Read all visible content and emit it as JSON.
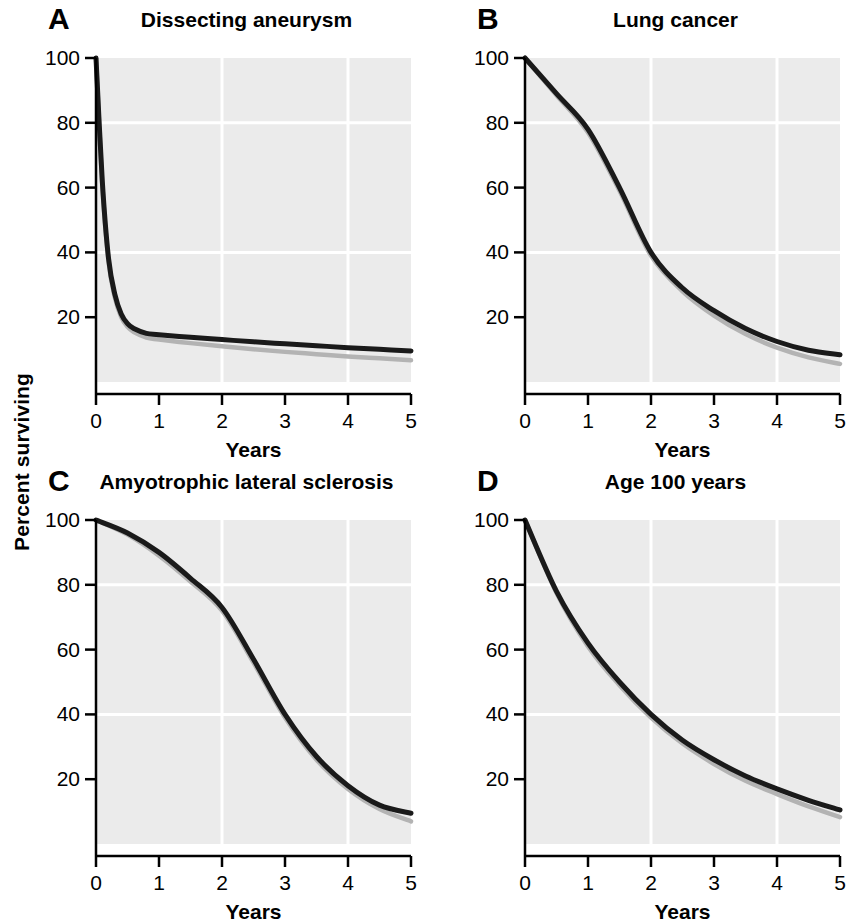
{
  "figure": {
    "shared_ylabel": "Percent surviving",
    "background_color": "#ffffff",
    "plot_area_color": "#ebebeb",
    "gridline_color": "#ffffff",
    "primary_curve_color": "#1a1a1a",
    "secondary_curve_color": "#b3b3b3",
    "axis_color": "#000000"
  },
  "axes_common": {
    "xlabel": "Years",
    "xticks": [
      "0",
      "1",
      "2",
      "3",
      "4",
      "5"
    ],
    "yticks": [
      "20",
      "40",
      "60",
      "80",
      "100"
    ],
    "xlim": [
      0,
      5
    ],
    "ylim": [
      0,
      100
    ],
    "x_gridlines": [
      2,
      4
    ],
    "y_gridlines": [
      40,
      80
    ]
  },
  "panels": [
    {
      "letter": "A",
      "title": "Dissecting aneurysm"
    },
    {
      "letter": "B",
      "title": "Lung cancer"
    },
    {
      "letter": "C",
      "title": "Amyotrophic lateral sclerosis"
    },
    {
      "letter": "D",
      "title": "Age 100 years"
    }
  ],
  "chart_data": [
    {
      "type": "line",
      "panel": "A",
      "title": "Dissecting aneurysm",
      "xlabel": "Years",
      "ylabel": "Percent surviving",
      "xlim": [
        0,
        5
      ],
      "ylim": [
        0,
        100
      ],
      "xticks": [
        0,
        1,
        2,
        3,
        4,
        5
      ],
      "yticks": [
        20,
        40,
        60,
        80,
        100
      ],
      "grid": true,
      "legend": "none",
      "x": [
        0,
        0.1,
        0.2,
        0.3,
        0.4,
        0.5,
        0.6,
        0.8,
        1,
        1.5,
        2,
        2.5,
        3,
        3.5,
        4,
        4.5,
        5
      ],
      "series": [
        {
          "name": "Observed survival",
          "color": "#1a1a1a",
          "values": [
            100,
            62,
            38,
            27,
            21,
            18,
            16.5,
            15,
            14.6,
            13.8,
            13.1,
            12.4,
            11.8,
            11.2,
            10.6,
            10.1,
            9.6
          ]
        },
        {
          "name": "Expected survival",
          "color": "#b3b3b3",
          "values": [
            100,
            61,
            37,
            26,
            20,
            17,
            15.4,
            13.7,
            13.1,
            12.0,
            11.0,
            10.1,
            9.3,
            8.6,
            7.9,
            7.3,
            6.7
          ]
        }
      ]
    },
    {
      "type": "line",
      "panel": "B",
      "title": "Lung cancer",
      "xlabel": "Years",
      "ylabel": "Percent surviving",
      "xlim": [
        0,
        5
      ],
      "ylim": [
        0,
        100
      ],
      "xticks": [
        0,
        1,
        2,
        3,
        4,
        5
      ],
      "yticks": [
        20,
        40,
        60,
        80,
        100
      ],
      "grid": true,
      "legend": "none",
      "x": [
        0,
        0.5,
        1,
        1.5,
        2,
        2.5,
        3,
        3.5,
        4,
        4.5,
        5
      ],
      "series": [
        {
          "name": "Observed survival",
          "color": "#1a1a1a",
          "values": [
            100,
            89,
            78,
            60,
            40,
            29,
            22,
            16.5,
            12.5,
            9.8,
            8.4
          ]
        },
        {
          "name": "Expected survival",
          "color": "#b3b3b3",
          "values": [
            100,
            88.5,
            77,
            59,
            39,
            28,
            20.5,
            14.8,
            10.6,
            7.6,
            5.6
          ]
        }
      ]
    },
    {
      "type": "line",
      "panel": "C",
      "title": "Amyotrophic lateral sclerosis",
      "xlabel": "Years",
      "ylabel": "Percent surviving",
      "xlim": [
        0,
        5
      ],
      "ylim": [
        0,
        100
      ],
      "xticks": [
        0,
        1,
        2,
        3,
        4,
        5
      ],
      "yticks": [
        20,
        40,
        60,
        80,
        100
      ],
      "grid": true,
      "legend": "none",
      "x": [
        0,
        0.5,
        1,
        1.5,
        2,
        2.5,
        3,
        3.5,
        4,
        4.5,
        5
      ],
      "series": [
        {
          "name": "Observed survival",
          "color": "#1a1a1a",
          "values": [
            100,
            96,
            90,
            82,
            73,
            57,
            40,
            27,
            18,
            12,
            9.5
          ]
        },
        {
          "name": "Expected survival",
          "color": "#b3b3b3",
          "values": [
            100,
            95.5,
            89,
            81,
            72,
            56,
            39,
            26,
            17,
            10.8,
            7.0
          ]
        }
      ]
    },
    {
      "type": "line",
      "panel": "D",
      "title": "Age 100 years",
      "xlabel": "Years",
      "ylabel": "Percent surviving",
      "xlim": [
        0,
        5
      ],
      "ylim": [
        0,
        100
      ],
      "xticks": [
        0,
        1,
        2,
        3,
        4,
        5
      ],
      "yticks": [
        20,
        40,
        60,
        80,
        100
      ],
      "grid": true,
      "legend": "none",
      "x": [
        0,
        0.5,
        1,
        1.5,
        2,
        2.5,
        3,
        3.5,
        4,
        4.5,
        5
      ],
      "series": [
        {
          "name": "Observed survival",
          "color": "#1a1a1a",
          "values": [
            100,
            78,
            62,
            50,
            40,
            32,
            26,
            21,
            17,
            13.5,
            10.5
          ]
        },
        {
          "name": "Expected survival",
          "color": "#b3b3b3",
          "values": [
            100,
            77.5,
            61,
            49,
            39,
            31,
            24.7,
            19.5,
            15.4,
            11.6,
            8.3
          ]
        }
      ]
    }
  ]
}
